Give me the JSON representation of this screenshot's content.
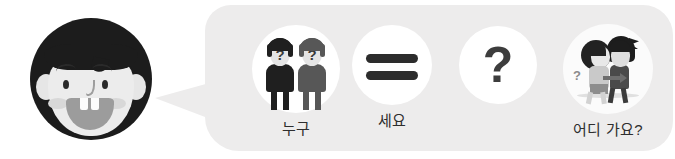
{
  "scene": {
    "title": "korean-phrase-flashcard-strip",
    "background_color": "#ffffff"
  },
  "avatar": {
    "name": "boy-face-avatar",
    "hair_color": "#1c1c1c",
    "face_color": "#ececec",
    "cheek_color": "#d8d8d8",
    "mouth_color": "#9c9c9c"
  },
  "bubble": {
    "name": "speech-bubble",
    "fill_color": "#edecec"
  },
  "items": [
    {
      "id": "who",
      "icon": "two-people-with-question-marks-icon",
      "caption": "누구",
      "person_left_question": "?",
      "person_right_question": "?"
    },
    {
      "id": "equals",
      "icon": "equals-sign-icon",
      "caption": "세요"
    },
    {
      "id": "question",
      "icon": "question-mark-icon",
      "glyph": "?",
      "caption": ""
    },
    {
      "id": "where",
      "icon": "couple-walking-icon",
      "caption": "어디 가요?",
      "thought_mark": "?"
    }
  ]
}
